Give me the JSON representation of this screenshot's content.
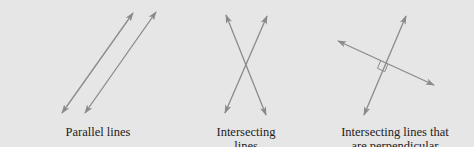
{
  "colors": {
    "background": "#e6e6e6",
    "line": "#8a8a8a",
    "text": "#222222"
  },
  "figures": [
    {
      "id": "parallel",
      "caption_lines": [
        "Parallel lines"
      ],
      "lines": [
        {
          "x1": 62,
          "y1": 113,
          "x2": 133,
          "y2": 13
        },
        {
          "x1": 85,
          "y1": 113,
          "x2": 156,
          "y2": 12
        }
      ]
    },
    {
      "id": "intersecting",
      "caption_lines": [
        "Intersecting",
        "lines"
      ],
      "lines": [
        {
          "x1": 226,
          "y1": 15,
          "x2": 266,
          "y2": 115
        },
        {
          "x1": 267,
          "y1": 16,
          "x2": 225,
          "y2": 113
        }
      ]
    },
    {
      "id": "perpendicular",
      "caption_lines": [
        "Intersecting lines that",
        "are perpendicular"
      ],
      "lines": [
        {
          "x1": 406,
          "y1": 16,
          "x2": 364,
          "y2": 115
        },
        {
          "x1": 338,
          "y1": 41,
          "x2": 434,
          "y2": 85
        }
      ],
      "right_angle_marker": true
    }
  ]
}
